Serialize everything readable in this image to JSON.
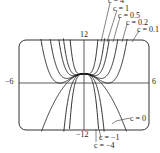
{
  "chart_data": {
    "type": "line",
    "title": "",
    "function": "y = c*x^4 - x^2 + 3",
    "xlabel": "",
    "ylabel": "",
    "xlim": [
      -6,
      6
    ],
    "ylim": [
      -12,
      12
    ],
    "ticks": {
      "ymax": "12",
      "ymin": "−12",
      "xmin": "−6",
      "xmax": "6"
    },
    "grid": false,
    "series": [
      {
        "name": "c = 4",
        "c": 4
      },
      {
        "name": "c = 1",
        "c": 1
      },
      {
        "name": "c = 0.5",
        "c": 0.5
      },
      {
        "name": "c = 0.2",
        "c": 0.2
      },
      {
        "name": "c = 0.1",
        "c": 0.1
      },
      {
        "name": "c = 0",
        "c": 0
      },
      {
        "name": "c = −1",
        "c": -1
      },
      {
        "name": "c = −4",
        "c": -4
      }
    ],
    "annotations": [
      {
        "text": "c = 4",
        "pos": "top"
      },
      {
        "text": "c = 1",
        "pos": "top"
      },
      {
        "text": "c = 0.5",
        "pos": "top"
      },
      {
        "text": "c = 0.2",
        "pos": "top"
      },
      {
        "text": "c = 0.1",
        "pos": "top"
      },
      {
        "text": "c = 0",
        "pos": "bottom-right"
      },
      {
        "text": "c = −1",
        "pos": "bottom"
      },
      {
        "text": "c = −4",
        "pos": "bottom"
      }
    ]
  },
  "labels": {
    "y_top": "12",
    "y_bottom": "−12",
    "x_left": "−6",
    "x_right": "6",
    "c4": "c = 4",
    "c1": "c = 1",
    "c05": "c = 0.5",
    "c02": "c = 0.2",
    "c01": "c = 0.1",
    "c0": "c = 0",
    "cm1": "c = −1",
    "cm4": "c = −4"
  },
  "colors": {
    "line": "#1a1a1a",
    "frame": "#333333"
  }
}
